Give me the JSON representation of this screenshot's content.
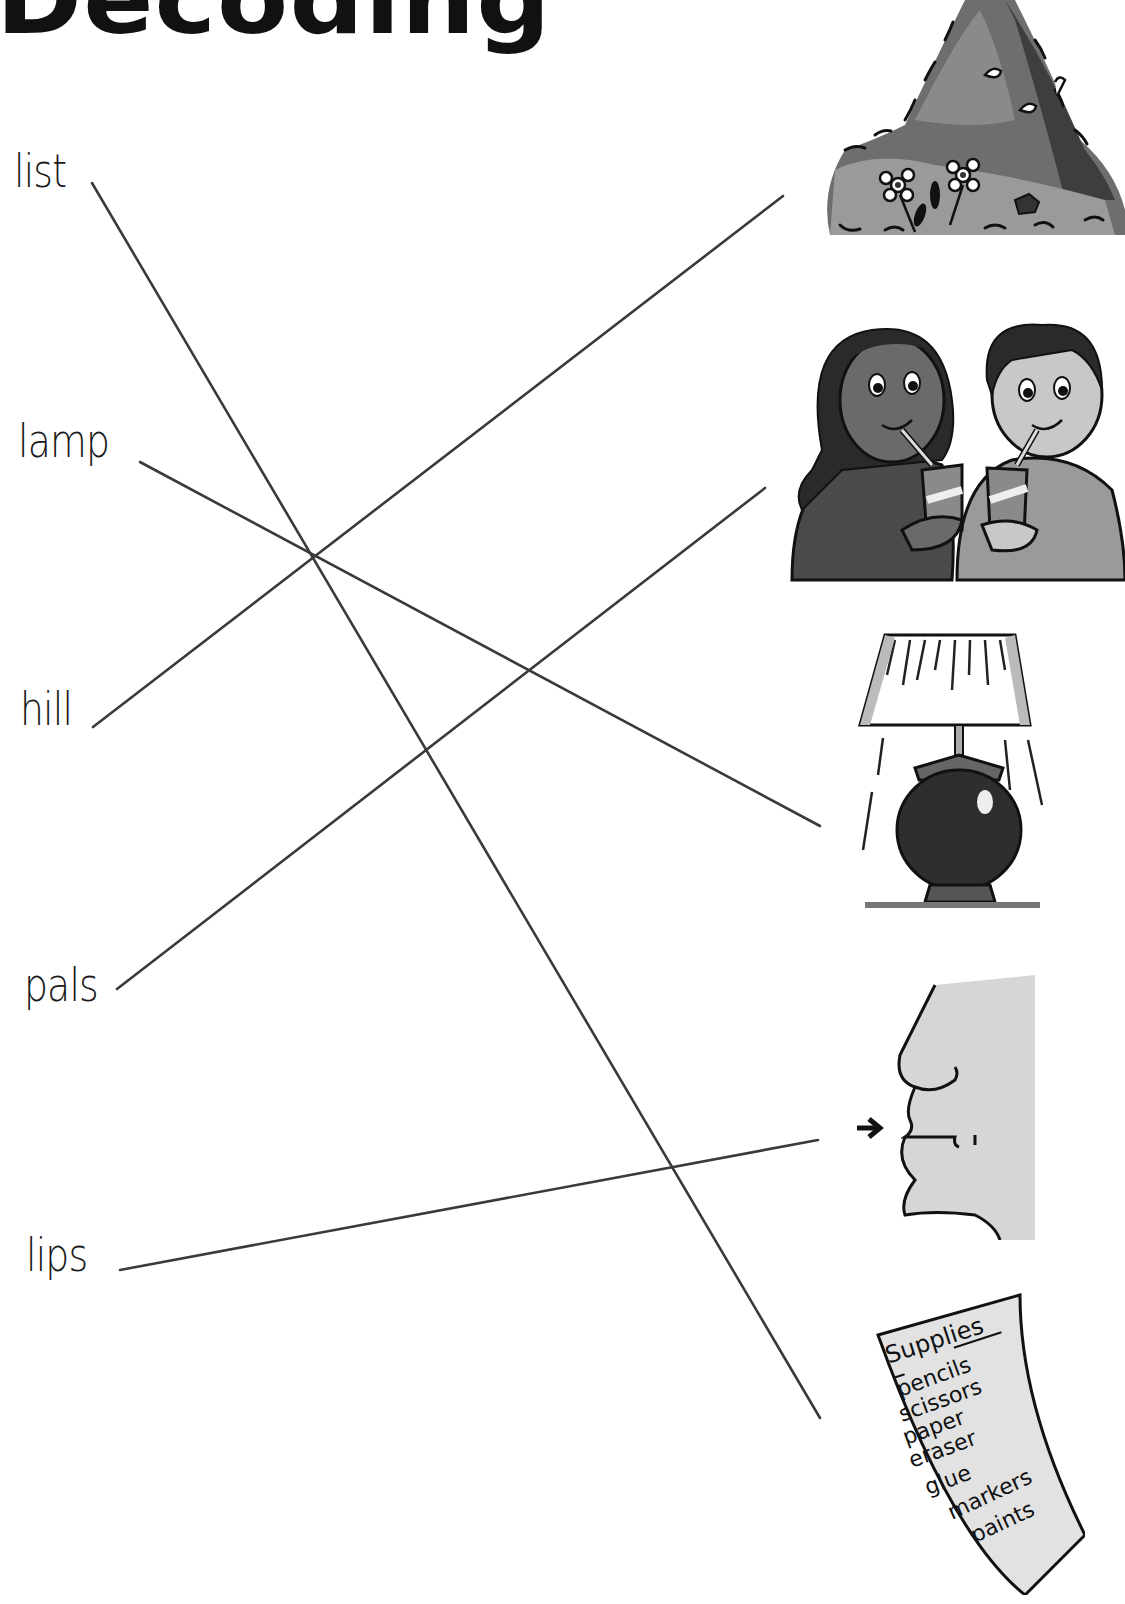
{
  "title": "Decoding",
  "words": [
    {
      "label": "list",
      "x": 14,
      "y": 148
    },
    {
      "label": "lamp",
      "x": 18,
      "y": 418
    },
    {
      "label": "hill",
      "x": 20,
      "y": 686
    },
    {
      "label": "pals",
      "x": 24,
      "y": 962
    },
    {
      "label": "lips",
      "x": 26,
      "y": 1232
    }
  ],
  "pictures": [
    {
      "name": "hill",
      "description": "grassy hill with flowers"
    },
    {
      "name": "pals",
      "description": "two kids drinking from juice boxes"
    },
    {
      "name": "lamp",
      "description": "table lamp with shade"
    },
    {
      "name": "lips",
      "description": "face profile with arrow pointing at lips"
    },
    {
      "name": "list",
      "description": "supplies list paper"
    }
  ],
  "supplies_list": {
    "heading": "Supplies",
    "items": [
      "pencils",
      "scissors",
      "paper",
      "eraser",
      "glue",
      "markers",
      "paints"
    ]
  },
  "matches": [
    {
      "word": "list",
      "picture": "list",
      "from": [
        92,
        183
      ],
      "to": [
        820,
        1418
      ]
    },
    {
      "word": "lamp",
      "picture": "lamp",
      "from": [
        140,
        462
      ],
      "to": [
        820,
        826
      ]
    },
    {
      "word": "hill",
      "picture": "hill",
      "from": [
        93,
        727
      ],
      "to": [
        783,
        196
      ]
    },
    {
      "word": "pals",
      "picture": "pals",
      "from": [
        117,
        989
      ],
      "to": [
        765,
        488
      ]
    },
    {
      "word": "lips",
      "picture": "lips",
      "from": [
        120,
        1270
      ],
      "to": [
        818,
        1140
      ]
    }
  ],
  "colors": {
    "line": "#3a3a3a",
    "ink": "#111111"
  }
}
